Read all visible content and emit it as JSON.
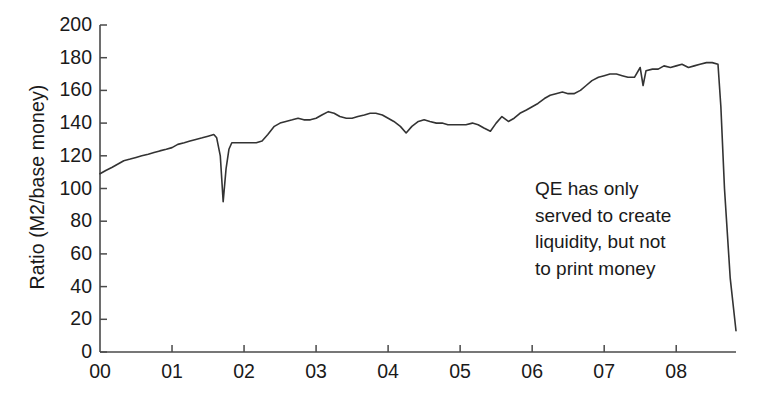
{
  "chart_data": {
    "type": "line",
    "title": "",
    "xlabel": "",
    "ylabel": "Ratio (M2/base money)",
    "ylim": [
      0,
      200
    ],
    "yticks": [
      0,
      20,
      40,
      60,
      80,
      100,
      120,
      140,
      160,
      180,
      200
    ],
    "ytick_labels": [
      "0",
      "20",
      "40",
      "60",
      "80",
      "100",
      "120",
      "140",
      "160",
      "180",
      "200"
    ],
    "xlim": [
      2000.0,
      2008.83
    ],
    "xticks": [
      2000,
      2001,
      2002,
      2003,
      2004,
      2005,
      2006,
      2007,
      2008
    ],
    "xtick_labels": [
      "00",
      "01",
      "02",
      "03",
      "04",
      "05",
      "06",
      "07",
      "08"
    ],
    "grid": false,
    "legend": null,
    "line_color": "#333333",
    "line_width": 1.6,
    "annotations": [
      {
        "text_lines": [
          "QE has only",
          "served to create",
          "liquidity, but not",
          "to print money"
        ],
        "x": 2007.0,
        "y": 108
      }
    ],
    "series": [
      {
        "name": "M2 to base money ratio",
        "x": [
          2000.0,
          2000.08,
          2000.17,
          2000.25,
          2000.33,
          2000.42,
          2000.5,
          2000.58,
          2000.67,
          2000.75,
          2000.83,
          2000.92,
          2001.0,
          2001.08,
          2001.17,
          2001.25,
          2001.33,
          2001.42,
          2001.5,
          2001.58,
          2001.62,
          2001.67,
          2001.71,
          2001.75,
          2001.79,
          2001.83,
          2001.92,
          2002.0,
          2002.08,
          2002.17,
          2002.25,
          2002.33,
          2002.42,
          2002.5,
          2002.58,
          2002.67,
          2002.75,
          2002.83,
          2002.92,
          2003.0,
          2003.08,
          2003.17,
          2003.25,
          2003.33,
          2003.42,
          2003.5,
          2003.58,
          2003.67,
          2003.75,
          2003.83,
          2003.92,
          2004.0,
          2004.08,
          2004.17,
          2004.25,
          2004.33,
          2004.42,
          2004.5,
          2004.58,
          2004.67,
          2004.75,
          2004.83,
          2004.92,
          2005.0,
          2005.08,
          2005.17,
          2005.25,
          2005.33,
          2005.42,
          2005.5,
          2005.58,
          2005.67,
          2005.75,
          2005.83,
          2005.92,
          2006.0,
          2006.08,
          2006.17,
          2006.25,
          2006.33,
          2006.42,
          2006.5,
          2006.58,
          2006.67,
          2006.75,
          2006.83,
          2006.92,
          2007.0,
          2007.08,
          2007.17,
          2007.25,
          2007.33,
          2007.42,
          2007.5,
          2007.54,
          2007.58,
          2007.67,
          2007.75,
          2007.83,
          2007.92,
          2008.0,
          2008.08,
          2008.17,
          2008.25,
          2008.33,
          2008.42,
          2008.5,
          2008.58,
          2008.62,
          2008.67,
          2008.75,
          2008.83
        ],
        "y": [
          109,
          111,
          113,
          115,
          117,
          118,
          119,
          120,
          121,
          122,
          123,
          124,
          125,
          127,
          128,
          129,
          130,
          131,
          132,
          133,
          131,
          120,
          92,
          112,
          124,
          128,
          128,
          128,
          128,
          128,
          129,
          133,
          138,
          140,
          141,
          142,
          143,
          142,
          142,
          143,
          145,
          147,
          146,
          144,
          143,
          143,
          144,
          145,
          146,
          146,
          145,
          143,
          141,
          138,
          134,
          138,
          141,
          142,
          141,
          140,
          140,
          139,
          139,
          139,
          139,
          140,
          139,
          137,
          135,
          140,
          144,
          141,
          143,
          146,
          148,
          150,
          152,
          155,
          157,
          158,
          159,
          158,
          158,
          160,
          163,
          166,
          168,
          169,
          170,
          170,
          169,
          168,
          168,
          174,
          163,
          172,
          173,
          173,
          175,
          174,
          175,
          176,
          174,
          175,
          176,
          177,
          177,
          176,
          150,
          100,
          45,
          13
        ]
      }
    ]
  },
  "axis_geometry": {
    "plot_left_px": 100,
    "plot_right_px": 736,
    "plot_top_px": 25,
    "plot_bottom_px": 352
  }
}
